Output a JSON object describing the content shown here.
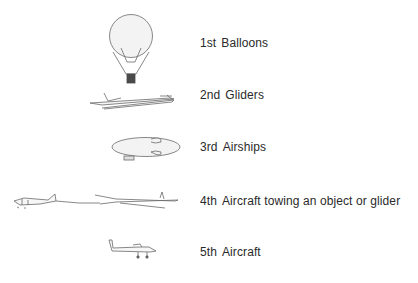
{
  "items": [
    {
      "rank": "1st",
      "label": "Balloons",
      "icon": "hot-air-balloon-icon"
    },
    {
      "rank": "2nd",
      "label": "Gliders",
      "icon": "glider-icon"
    },
    {
      "rank": "3rd",
      "label": "Airships",
      "icon": "airship-icon"
    },
    {
      "rank": "4th",
      "label": "Aircraft towing an object or glider",
      "icon": "aircraft-towing-glider-icon"
    },
    {
      "rank": "5th",
      "label": "Aircraft",
      "icon": "aircraft-icon"
    }
  ],
  "colors": {
    "line": "#6a6a6a",
    "fill": "#f2f2f2",
    "basket": "#4a4a4a",
    "text": "#2a2a2a"
  }
}
